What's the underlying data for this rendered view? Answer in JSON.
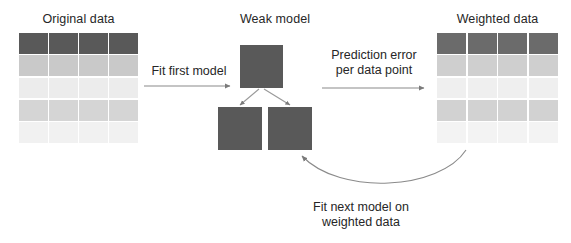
{
  "figure": {
    "background_color": "#ffffff",
    "text_color": "#262626",
    "node_color": "#595959",
    "connector_color": "#808080"
  },
  "panels": {
    "original": {
      "title": "Original data",
      "columns": 4,
      "rows": 5,
      "row_colors": [
        "#595959",
        "#c9c9c9",
        "#ececec",
        "#d5d5d5",
        "#f1f1f1"
      ]
    },
    "weighted": {
      "title": "Weighted data",
      "columns": 4,
      "rows": 5,
      "row_colors": [
        "#6b6b6b",
        "#cfcfcf",
        "#efefef",
        "#d2d2d2",
        "#f3f3f3"
      ]
    },
    "model": {
      "title": "Weak model",
      "nodes": [
        {
          "name": "root-node"
        },
        {
          "name": "left-leaf-node"
        },
        {
          "name": "right-leaf-node"
        }
      ]
    }
  },
  "arrows": {
    "fit_first": {
      "label": "Fit first model"
    },
    "prediction_error": {
      "label_line1": "Prediction error",
      "label_line2": "per data point"
    },
    "fit_next": {
      "label_line1": "Fit next model on",
      "label_line2": "weighted data"
    }
  }
}
